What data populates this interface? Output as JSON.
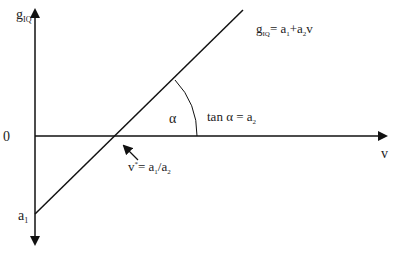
{
  "diagram": {
    "y_axis_label_main": "g",
    "y_axis_label_sub": "IQ",
    "x_axis_label": "v",
    "origin_label": "0",
    "intercept_label_main": "a",
    "intercept_label_sub": "1",
    "line_equation": {
      "g": "g",
      "g_sub": "IQ",
      "eq": "= a",
      "a1_sub": "1",
      "plus": "+a",
      "a2_sub": "2",
      "v": "v"
    },
    "angle_label": "α",
    "slope_label": {
      "text": "tan α = a",
      "sub": "2"
    },
    "root_label": {
      "v": "v",
      "sup": "*",
      "eq": "= a",
      "a1_sub": "1",
      "slash": "/a",
      "a2_sub": "2"
    },
    "colors": {
      "axis": "#111111",
      "line": "#111111",
      "text": "#222222"
    }
  }
}
